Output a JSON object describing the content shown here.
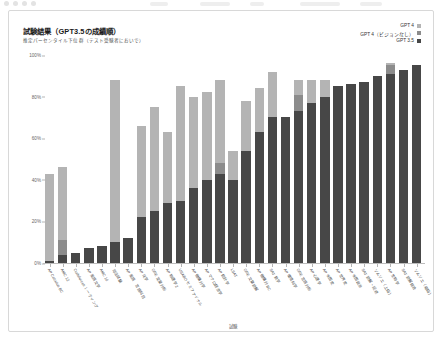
{
  "window": {
    "chrome_visible": true
  },
  "card": {
    "title": "試験結果（GPT3.5の成績順）",
    "subtitle": "推定パーセンタイル下位群（テスト受験者においで）"
  },
  "legend": {
    "position": "top-right",
    "items": [
      {
        "label": "GPT 4",
        "color": "#b4b4b4"
      },
      {
        "label": "GPT 4（ビジョンなし）",
        "color": "#8c8c8c"
      },
      {
        "label": "GPT 3.5",
        "color": "#474747"
      }
    ]
  },
  "chart_data": {
    "type": "bar",
    "title": "試験結果（GPT3.5の成績順）",
    "subtitle": "推定パーセンタイル下位群（テスト受験者においで）",
    "xlabel": "試験",
    "ylabel": "",
    "ylim": [
      0,
      100
    ],
    "yticks": [
      "0%",
      "20%",
      "40%",
      "60%",
      "80%",
      "100%"
    ],
    "ytick_values": [
      0,
      20,
      40,
      60,
      80,
      100
    ],
    "grid": false,
    "stacked": true,
    "sort_order": "GPT 3.5 昇順",
    "legend_position": "top-right",
    "categories": [
      "AP Calculus BC",
      "AMC 12",
      "Codeforces レーティング",
      "AP 英語文学",
      "AMC 10",
      "司法試験",
      "AP 英語　言語科目",
      "AP 化学",
      "GRE 定量分析",
      "AP 物理学 2",
      "USABO セミファイナル",
      "AP 微積分学",
      "AP マクロ経済学",
      "AP 統計学",
      "LSAT",
      "GRE 文章読解",
      "AP 微積分 BC",
      "SAT 数学",
      "AP 環境科学",
      "GRE 言語分析",
      "AP 心理学",
      "AP 米国史",
      "AP 世界史",
      "AP 米国政治",
      "SAT 読解・記述",
      "ソムリエ（上級）",
      "AP 生物学",
      "SAT 読解総合",
      "ソムリエ（初級）"
    ],
    "series": [
      {
        "name": "GPT 3.5",
        "color": "#474747",
        "values": [
          1,
          4,
          5,
          7,
          8,
          10,
          12,
          22,
          25,
          29,
          30,
          36,
          40,
          43,
          40,
          54,
          63,
          70,
          70,
          73,
          77,
          80,
          85,
          86,
          87,
          90,
          91,
          93,
          95
        ]
      },
      {
        "name": "GPT 4（ビジョンなし）",
        "color": "#8c8c8c",
        "values": [
          1,
          11,
          5,
          7,
          8,
          10,
          12,
          22,
          25,
          29,
          30,
          36,
          40,
          48,
          40,
          54,
          63,
          70,
          70,
          81,
          77,
          80,
          85,
          86,
          87,
          90,
          95,
          93,
          95
        ]
      },
      {
        "name": "GPT 4",
        "color": "#b4b4b4",
        "values": [
          43,
          46,
          5,
          7,
          8,
          88,
          12,
          66,
          75,
          63,
          85,
          80,
          82,
          88,
          54,
          78,
          84,
          92,
          70,
          88,
          88,
          88,
          85,
          86,
          87,
          90,
          96,
          93,
          95
        ]
      }
    ]
  }
}
